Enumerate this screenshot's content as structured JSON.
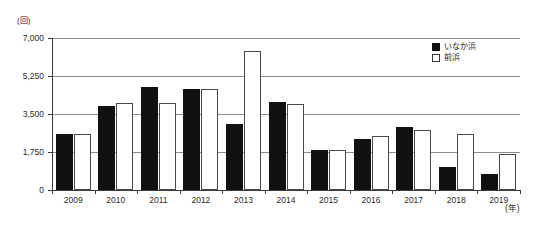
{
  "chart_data": {
    "type": "bar",
    "title": "",
    "subtitle": "",
    "xlabel": "(年)",
    "ylabel": "(回)",
    "y_unit_label": "(回)",
    "x_unit_label": "(年)",
    "categories": [
      "2009",
      "2010",
      "2011",
      "2012",
      "2013",
      "2014",
      "2015",
      "2016",
      "2017",
      "2018",
      "2019"
    ],
    "series": [
      {
        "name": "いなか浜",
        "color": "#111111",
        "style": "filled",
        "values": [
          2600,
          3850,
          4750,
          4650,
          3050,
          4050,
          1850,
          2350,
          2900,
          1050,
          750
        ]
      },
      {
        "name": "前浜",
        "color": "#ffffff",
        "style": "outlined",
        "values": [
          2600,
          4000,
          4000,
          4650,
          6400,
          3950,
          1850,
          2500,
          2750,
          2600,
          1650
        ]
      }
    ],
    "ylim": [
      0,
      7000
    ],
    "yticks": [
      0,
      1750,
      3500,
      5250,
      7000
    ],
    "ytick_labels": [
      "0",
      "1,750",
      "3,500",
      "5,250",
      "7,000"
    ],
    "grid": true,
    "grid_axis": "y",
    "legend_position": "top-right-inside"
  },
  "legend": {
    "entries": [
      {
        "label": "いなか浜",
        "swatch": "filled-black-swatch"
      },
      {
        "label": "前浜",
        "swatch": "outlined-white-swatch"
      }
    ]
  }
}
